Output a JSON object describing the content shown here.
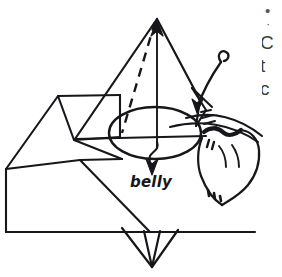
{
  "figure": {
    "kind": "origami-instruction-diagram",
    "ink_color": "#17161a",
    "background_color": "#ffffff",
    "labels": {
      "belly": "belly"
    },
    "annotations": [
      {
        "name": "up-arrow-apex",
        "meaning": "pull up at apex"
      },
      {
        "name": "down-arrow-belly",
        "meaning": "push down into belly"
      },
      {
        "name": "curved-hook-arrow",
        "meaning": "rotate flap over and down"
      },
      {
        "name": "dashed-fold-line",
        "meaning": "valley fold"
      }
    ]
  },
  "margin_text": {
    "lines": [
      "•",
      "·",
      "C",
      "t",
      "c"
    ]
  }
}
